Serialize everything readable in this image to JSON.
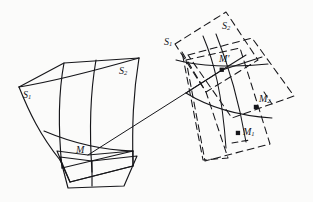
{
  "figure": {
    "type": "geometry-diagram",
    "background_color": "#fbfbfa",
    "stroke_color": "#16161a",
    "left_surface": {
      "name": "patch-left",
      "style": "solid",
      "labels": {
        "s1": "S",
        "s1_sub": "1",
        "s2": "S",
        "s2_sub": "2",
        "m": "M"
      }
    },
    "right_surface": {
      "name": "patch-right",
      "style": "dashed",
      "labels": {
        "s1": "S",
        "s1_sub": "1",
        "s2": "S",
        "s2_sub": "2",
        "m_prime": "M",
        "m_prime_mark": "'",
        "m1": "M",
        "m1_sub": "1",
        "m2": "M",
        "m2_sub": "2"
      }
    },
    "connector": {
      "name": "correspondence-line",
      "from": "M",
      "to": "M'"
    },
    "points": [
      {
        "id": "M",
        "x": 88,
        "y": 155,
        "marked": false
      },
      {
        "id": "Mp",
        "x": 222,
        "y": 70,
        "marked": true
      },
      {
        "id": "M1",
        "x": 238,
        "y": 133,
        "marked": true
      },
      {
        "id": "M2",
        "x": 256,
        "y": 107,
        "marked": true
      }
    ],
    "label_positions": {
      "left_s1": {
        "x": 23,
        "y": 90
      },
      "left_s2": {
        "x": 119,
        "y": 66
      },
      "left_m": {
        "x": 76,
        "y": 145
      },
      "right_s1": {
        "x": 164,
        "y": 37
      },
      "right_s2": {
        "x": 222,
        "y": 21
      },
      "right_mp": {
        "x": 219,
        "y": 54
      },
      "right_m1": {
        "x": 243,
        "y": 127
      },
      "right_m2": {
        "x": 259,
        "y": 94
      }
    }
  }
}
